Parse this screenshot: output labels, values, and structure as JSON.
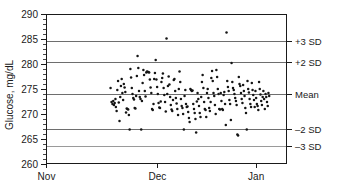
{
  "chart_data": {
    "type": "scatter",
    "title": "",
    "subtitle": "",
    "xlabel": "",
    "ylabel": "Glucose, mg/dL",
    "ylim": [
      260,
      290
    ],
    "y_ticks": [
      260,
      265,
      270,
      275,
      280,
      285,
      290
    ],
    "y_tick_labels": [
      "260",
      "265",
      "270",
      "275",
      "280",
      "285",
      "290"
    ],
    "y_minor_tick_step": 1,
    "x_tick_labels": [
      "Nov",
      "Dec",
      "Jan"
    ],
    "x_tick_positions": [
      0.0,
      0.46,
      0.87
    ],
    "xlim": [
      0,
      1
    ],
    "grid": true,
    "grid_axis": "y",
    "legend": "none",
    "reference_lines": [
      {
        "label": "+3 SD",
        "value": 284.7,
        "style": "solid-gray"
      },
      {
        "label": "+2 SD",
        "value": 280.5,
        "style": "solid-gray"
      },
      {
        "label": "Mean",
        "value": 274.0,
        "style": "solid-dark"
      },
      {
        "label": "-2 SD",
        "value": 267.0,
        "style": "solid-gray"
      },
      {
        "label": "-3 SD",
        "value": 263.7,
        "style": "solid-light"
      }
    ],
    "statistics": {
      "mean": 274.0,
      "sd": 3.45
    },
    "series": [
      {
        "name": "Glucose control measurements",
        "marker": "dot",
        "color": "#141414",
        "points": [
          [
            0.268,
            275.2
          ],
          [
            0.272,
            272.4
          ],
          [
            0.276,
            272.0
          ],
          [
            0.279,
            272.6
          ],
          [
            0.282,
            271.8
          ],
          [
            0.285,
            272.2
          ],
          [
            0.288,
            273.0
          ],
          [
            0.29,
            271.4
          ],
          [
            0.293,
            270.6
          ],
          [
            0.296,
            274.8
          ],
          [
            0.299,
            276.6
          ],
          [
            0.302,
            272.3
          ],
          [
            0.305,
            268.6
          ],
          [
            0.308,
            273.4
          ],
          [
            0.311,
            275.6
          ],
          [
            0.314,
            277.0
          ],
          [
            0.317,
            274.2
          ],
          [
            0.32,
            272.8
          ],
          [
            0.323,
            276.0
          ],
          [
            0.326,
            275.3
          ],
          [
            0.329,
            274.4
          ],
          [
            0.332,
            270.3
          ],
          [
            0.335,
            271.1
          ],
          [
            0.338,
            271.0
          ],
          [
            0.341,
            270.9
          ],
          [
            0.344,
            269.8
          ],
          [
            0.347,
            266.9
          ],
          [
            0.35,
            279.0
          ],
          [
            0.353,
            277.3
          ],
          [
            0.356,
            275.2
          ],
          [
            0.359,
            274.0
          ],
          [
            0.362,
            273.2
          ],
          [
            0.365,
            272.9
          ],
          [
            0.368,
            271.2
          ],
          [
            0.371,
            271.1
          ],
          [
            0.374,
            273.6
          ],
          [
            0.377,
            277.6
          ],
          [
            0.38,
            281.6
          ],
          [
            0.383,
            279.2
          ],
          [
            0.386,
            274.6
          ],
          [
            0.389,
            273.4
          ],
          [
            0.392,
            273.0
          ],
          [
            0.395,
            266.9
          ],
          [
            0.398,
            272.6
          ],
          [
            0.401,
            276.2
          ],
          [
            0.404,
            278.8
          ],
          [
            0.407,
            277.8
          ],
          [
            0.41,
            274.6
          ],
          [
            0.413,
            273.5
          ],
          [
            0.416,
            278.3
          ],
          [
            0.419,
            278.5
          ],
          [
            0.422,
            278.4
          ],
          [
            0.425,
            278.4
          ],
          [
            0.428,
            278.3
          ],
          [
            0.431,
            276.9
          ],
          [
            0.434,
            275.3
          ],
          [
            0.437,
            274.2
          ],
          [
            0.44,
            271.0
          ],
          [
            0.443,
            270.8
          ],
          [
            0.446,
            272.0
          ],
          [
            0.449,
            277.0
          ],
          [
            0.452,
            278.2
          ],
          [
            0.455,
            280.8
          ],
          [
            0.458,
            276.9
          ],
          [
            0.461,
            275.4
          ],
          [
            0.464,
            274.0
          ],
          [
            0.467,
            272.2
          ],
          [
            0.47,
            271.3
          ],
          [
            0.473,
            271.2
          ],
          [
            0.476,
            272.5
          ],
          [
            0.479,
            276.4
          ],
          [
            0.482,
            277.2
          ],
          [
            0.485,
            278.1
          ],
          [
            0.488,
            275.2
          ],
          [
            0.491,
            273.8
          ],
          [
            0.494,
            272.4
          ],
          [
            0.497,
            270.5
          ],
          [
            0.5,
            285.1
          ],
          [
            0.503,
            274.0
          ],
          [
            0.506,
            275.6
          ],
          [
            0.509,
            277.5
          ],
          [
            0.512,
            275.9
          ],
          [
            0.515,
            273.4
          ],
          [
            0.518,
            271.8
          ],
          [
            0.521,
            270.9
          ],
          [
            0.524,
            270.6
          ],
          [
            0.527,
            272.8
          ],
          [
            0.53,
            276.8
          ],
          [
            0.533,
            277.0
          ],
          [
            0.536,
            274.6
          ],
          [
            0.539,
            273.2
          ],
          [
            0.542,
            272.1
          ],
          [
            0.545,
            271.0
          ],
          [
            0.548,
            269.8
          ],
          [
            0.551,
            275.0
          ],
          [
            0.554,
            278.5
          ],
          [
            0.557,
            276.4
          ],
          [
            0.56,
            273.0
          ],
          [
            0.563,
            271.6
          ],
          [
            0.566,
            271.2
          ],
          [
            0.569,
            270.0
          ],
          [
            0.572,
            266.9
          ],
          [
            0.575,
            273.6
          ],
          [
            0.578,
            274.8
          ],
          [
            0.581,
            272.0
          ],
          [
            0.584,
            271.4
          ],
          [
            0.587,
            271.5
          ],
          [
            0.59,
            270.4
          ],
          [
            0.593,
            269.2
          ],
          [
            0.596,
            268.4
          ],
          [
            0.599,
            275.0
          ],
          [
            0.602,
            274.8
          ],
          [
            0.605,
            274.6
          ],
          [
            0.608,
            274.7
          ],
          [
            0.611,
            272.0
          ],
          [
            0.614,
            271.0
          ],
          [
            0.617,
            270.2
          ],
          [
            0.62,
            269.0
          ],
          [
            0.623,
            266.3
          ],
          [
            0.626,
            272.5
          ],
          [
            0.629,
            274.2
          ],
          [
            0.632,
            273.0
          ],
          [
            0.635,
            271.6
          ],
          [
            0.638,
            270.2
          ],
          [
            0.641,
            269.4
          ],
          [
            0.644,
            273.4
          ],
          [
            0.647,
            276.4
          ],
          [
            0.65,
            277.8
          ],
          [
            0.653,
            275.2
          ],
          [
            0.656,
            272.4
          ],
          [
            0.659,
            271.0
          ],
          [
            0.662,
            270.8
          ],
          [
            0.665,
            269.4
          ],
          [
            0.668,
            274.2
          ],
          [
            0.671,
            275.0
          ],
          [
            0.674,
            273.2
          ],
          [
            0.677,
            271.2
          ],
          [
            0.68,
            270.6
          ],
          [
            0.683,
            272.4
          ],
          [
            0.686,
            277.2
          ],
          [
            0.689,
            278.6
          ],
          [
            0.692,
            276.6
          ],
          [
            0.695,
            274.2
          ],
          [
            0.698,
            273.6
          ],
          [
            0.701,
            271.8
          ],
          [
            0.704,
            270.0
          ],
          [
            0.707,
            278.8
          ],
          [
            0.71,
            277.4
          ],
          [
            0.713,
            275.0
          ],
          [
            0.716,
            274.0
          ],
          [
            0.719,
            271.0
          ],
          [
            0.722,
            270.9
          ],
          [
            0.725,
            274.2
          ],
          [
            0.728,
            272.6
          ],
          [
            0.731,
            271.0
          ],
          [
            0.734,
            270.8
          ],
          [
            0.737,
            273.8
          ],
          [
            0.74,
            274.4
          ],
          [
            0.743,
            272.0
          ],
          [
            0.746,
            267.8
          ],
          [
            0.749,
            286.3
          ],
          [
            0.752,
            276.6
          ],
          [
            0.755,
            275.4
          ],
          [
            0.758,
            274.6
          ],
          [
            0.761,
            272.8
          ],
          [
            0.764,
            272.0
          ],
          [
            0.767,
            268.8
          ],
          [
            0.77,
            280.2
          ],
          [
            0.773,
            276.4
          ],
          [
            0.776,
            275.2
          ],
          [
            0.779,
            274.8
          ],
          [
            0.782,
            274.0
          ],
          [
            0.785,
            273.2
          ],
          [
            0.788,
            272.6
          ],
          [
            0.791,
            271.8
          ],
          [
            0.794,
            265.9
          ],
          [
            0.797,
            265.7
          ],
          [
            0.8,
            277.4
          ],
          [
            0.803,
            276.0
          ],
          [
            0.806,
            275.6
          ],
          [
            0.809,
            274.2
          ],
          [
            0.812,
            273.0
          ],
          [
            0.815,
            272.2
          ],
          [
            0.818,
            275.8
          ],
          [
            0.821,
            274.6
          ],
          [
            0.824,
            273.6
          ],
          [
            0.827,
            271.2
          ],
          [
            0.83,
            270.2
          ],
          [
            0.833,
            266.9
          ],
          [
            0.836,
            276.6
          ],
          [
            0.839,
            275.0
          ],
          [
            0.842,
            274.3
          ],
          [
            0.845,
            273.0
          ],
          [
            0.848,
            272.0
          ],
          [
            0.851,
            271.4
          ],
          [
            0.854,
            276.2
          ],
          [
            0.857,
            274.8
          ],
          [
            0.86,
            273.8
          ],
          [
            0.863,
            272.8
          ],
          [
            0.866,
            271.4
          ],
          [
            0.869,
            274.6
          ],
          [
            0.872,
            273.2
          ],
          [
            0.875,
            272.0
          ],
          [
            0.878,
            271.6
          ],
          [
            0.881,
            270.8
          ],
          [
            0.884,
            276.4
          ],
          [
            0.887,
            275.0
          ],
          [
            0.89,
            273.9
          ],
          [
            0.893,
            272.6
          ],
          [
            0.896,
            271.8
          ],
          [
            0.899,
            273.4
          ],
          [
            0.902,
            274.6
          ],
          [
            0.905,
            273.0
          ],
          [
            0.908,
            271.0
          ],
          [
            0.911,
            274.0
          ],
          [
            0.914,
            273.4
          ],
          [
            0.917,
            272.4
          ],
          [
            0.92,
            271.6
          ],
          [
            0.923,
            274.2
          ],
          [
            0.926,
            273.6
          ]
        ]
      }
    ]
  },
  "axes": {
    "y_title": "Glucose, mg/dL"
  }
}
